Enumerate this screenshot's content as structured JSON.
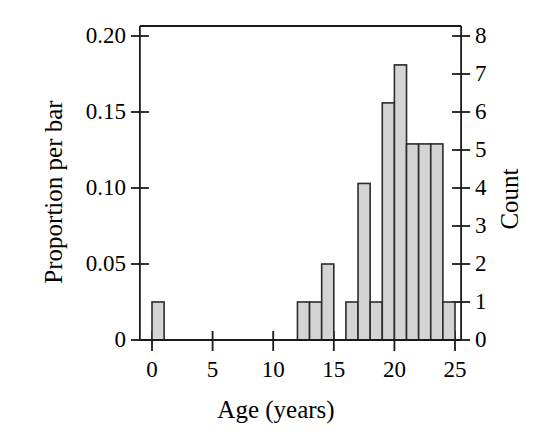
{
  "chart_data": {
    "type": "bar",
    "title": "",
    "subtitle": "",
    "xlabel": "Age (years)",
    "ylabel": "Proportion per bar",
    "ylabel_secondary": "Count",
    "xlim": [
      -1,
      26
    ],
    "ylim": [
      0,
      0.2
    ],
    "ylim_secondary": [
      0,
      8
    ],
    "grid": false,
    "legend": null,
    "bin_width": 1,
    "total_count": 40,
    "proportion_per_count": 0.025,
    "xticks": [
      "0",
      "5",
      "10",
      "15",
      "20",
      "25"
    ],
    "xtick_values": [
      0,
      5,
      10,
      15,
      20,
      25
    ],
    "yticks_left": [
      "0",
      "0.05",
      "0.10",
      "0.15",
      "0.20"
    ],
    "ytick_values_left": [
      0,
      0.05,
      0.1,
      0.15,
      0.2
    ],
    "yticks_right": [
      "0",
      "1",
      "2",
      "3",
      "4",
      "5",
      "6",
      "7",
      "8"
    ],
    "ytick_values_right": [
      0,
      1,
      2,
      3,
      4,
      5,
      6,
      7,
      8
    ],
    "bins": [
      {
        "x0": 0,
        "x1": 1,
        "count": 1,
        "proportion": 0.025
      },
      {
        "x0": 12,
        "x1": 13,
        "count": 1,
        "proportion": 0.025
      },
      {
        "x0": 13,
        "x1": 14,
        "count": 1,
        "proportion": 0.025
      },
      {
        "x0": 14,
        "x1": 15,
        "count": 2,
        "proportion": 0.05
      },
      {
        "x0": 16,
        "x1": 17,
        "count": 1,
        "proportion": 0.025
      },
      {
        "x0": 17,
        "x1": 18,
        "count": 4,
        "proportion": 0.103
      },
      {
        "x0": 18,
        "x1": 19,
        "count": 1,
        "proportion": 0.025
      },
      {
        "x0": 19,
        "x1": 20,
        "count": 6,
        "proportion": 0.156
      },
      {
        "x0": 20,
        "x1": 21,
        "count": 7,
        "proportion": 0.181
      },
      {
        "x0": 21,
        "x1": 22,
        "count": 5,
        "proportion": 0.129
      },
      {
        "x0": 22,
        "x1": 23,
        "count": 5,
        "proportion": 0.129
      },
      {
        "x0": 23,
        "x1": 24,
        "count": 5,
        "proportion": 0.129
      },
      {
        "x0": 24,
        "x1": 25,
        "count": 1,
        "proportion": 0.025
      }
    ],
    "categories": [
      "0-1",
      "12-13",
      "13-14",
      "14-15",
      "16-17",
      "17-18",
      "18-19",
      "19-20",
      "20-21",
      "21-22",
      "22-23",
      "23-24",
      "24-25"
    ],
    "values": [
      0.025,
      0.025,
      0.025,
      0.05,
      0.025,
      0.103,
      0.025,
      0.156,
      0.181,
      0.129,
      0.129,
      0.129,
      0.025
    ],
    "colors": {
      "bar_fill": "#d4d4d4",
      "bar_edge": "#2b2b2b",
      "axis": "#1a1a1a",
      "text": "#000000",
      "background": "#ffffff"
    }
  }
}
